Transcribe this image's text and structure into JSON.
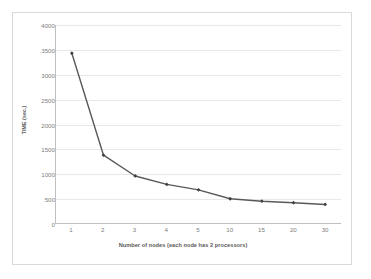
{
  "chart_data": {
    "type": "line",
    "title": "",
    "xlabel": "Number of nodes (each node has 2 processors)",
    "ylabel": "TIME (sec.)",
    "categories": [
      "1",
      "2",
      "3",
      "4",
      "5",
      "10",
      "15",
      "20",
      "30"
    ],
    "values": [
      3430,
      1370,
      950,
      780,
      670,
      490,
      440,
      410,
      375
    ],
    "series": [
      {
        "name": "TIME (sec.)",
        "values": [
          3430,
          1370,
          950,
          780,
          670,
          490,
          440,
          410,
          375
        ]
      }
    ],
    "ylim": [
      0,
      4000
    ],
    "yticks": [
      0,
      500,
      1000,
      1500,
      2000,
      2500,
      3000,
      3500,
      4000
    ],
    "ytick_labels": [
      "0",
      "500",
      "1000",
      "1500",
      "2000",
      "2500",
      "3000",
      "3500",
      "4000"
    ],
    "xtick_labels": [
      "1",
      "2",
      "3",
      "4",
      "5",
      "10",
      "15",
      "20",
      "30"
    ],
    "grid": "horizontal",
    "legend": "none",
    "line_color": "#595959",
    "marker_color": "#404040",
    "grid_color": "#E8E8E8",
    "axis_color": "#BFBFBF",
    "tick_label_color": "#808080",
    "axis_title_color": "#595959",
    "background_color": "#FFFFFF",
    "border_color": "#D9D9D9"
  }
}
